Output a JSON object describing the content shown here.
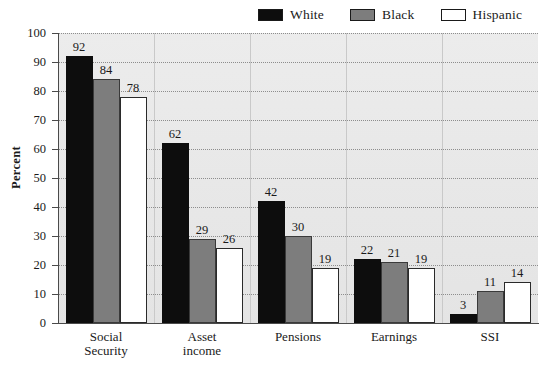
{
  "chart_data": {
    "type": "bar",
    "title": "",
    "xlabel": "",
    "ylabel": "Percent",
    "ylim": [
      0,
      100
    ],
    "ytick_step": 10,
    "grid": "horizontal-dotted",
    "legend_position": "top-right",
    "categories": [
      "Social Security",
      "Asset income",
      "Pensions",
      "Earnings",
      "SSI"
    ],
    "category_lines": [
      [
        "Social",
        "Security"
      ],
      [
        "Asset",
        "income"
      ],
      [
        "Pensions"
      ],
      [
        "Earnings"
      ],
      [
        "SSI"
      ]
    ],
    "yticks": [
      "0",
      "10",
      "20",
      "30",
      "40",
      "50",
      "60",
      "70",
      "80",
      "90",
      "100"
    ],
    "series": [
      {
        "name": "White",
        "color": "#0d0d0d",
        "values": [
          92,
          62,
          42,
          22,
          3
        ]
      },
      {
        "name": "Black",
        "color": "#7d7d7d",
        "values": [
          84,
          29,
          30,
          21,
          11
        ]
      },
      {
        "name": "Hispanic",
        "color": "#ffffff",
        "values": [
          78,
          26,
          19,
          19,
          14
        ]
      }
    ]
  },
  "legend": {
    "items": [
      {
        "label": "White",
        "swatch": "black-swatch"
      },
      {
        "label": "Black",
        "swatch": "gray-swatch"
      },
      {
        "label": "Hispanic",
        "swatch": "white-swatch"
      }
    ]
  },
  "axis": {
    "y_title": "Percent"
  },
  "colors": {
    "white_series": "#0d0d0d",
    "black_series": "#7d7d7d",
    "hispanic_series": "#ffffff",
    "plot_background": "#e9e9e9",
    "grid": "#8d8d8d",
    "axis": "#4a4a4a"
  }
}
